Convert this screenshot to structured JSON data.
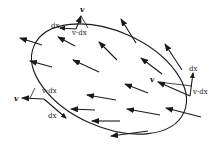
{
  "figure": {
    "colors": {
      "stroke": "#1a1a1a",
      "background": "#ffffff"
    },
    "curve": {
      "shape": "ellipse",
      "cx": 109,
      "cy": 79,
      "rx": 82,
      "ry": 48,
      "rotation_deg": 24
    },
    "field_arrows": [
      {
        "x1": 42,
        "y1": 45,
        "x2": 20,
        "y2": 38
      },
      {
        "x1": 75,
        "y1": 46,
        "x2": 58,
        "y2": 37
      },
      {
        "x1": 117,
        "y1": 60,
        "x2": 99,
        "y2": 42
      },
      {
        "x1": 136,
        "y1": 43,
        "x2": 121,
        "y2": 19
      },
      {
        "x1": 182,
        "y1": 70,
        "x2": 165,
        "y2": 44
      },
      {
        "x1": 52,
        "y1": 67,
        "x2": 30,
        "y2": 61
      },
      {
        "x1": 99,
        "y1": 72,
        "x2": 73,
        "y2": 60
      },
      {
        "x1": 162,
        "y1": 74,
        "x2": 141,
        "y2": 58
      },
      {
        "x1": 148,
        "y1": 93,
        "x2": 125,
        "y2": 84
      },
      {
        "x1": 116,
        "y1": 100,
        "x2": 87,
        "y2": 95
      },
      {
        "x1": 95,
        "y1": 110,
        "x2": 71,
        "y2": 109
      },
      {
        "x1": 160,
        "y1": 115,
        "x2": 127,
        "y2": 109
      },
      {
        "x1": 201,
        "y1": 117,
        "x2": 166,
        "y2": 108
      },
      {
        "x1": 120,
        "y1": 121,
        "x2": 92,
        "y2": 121
      },
      {
        "x1": 148,
        "y1": 131,
        "x2": 111,
        "y2": 136
      }
    ],
    "points": [
      {
        "name": "top",
        "v_label": "v",
        "dx_label": "dx",
        "dot_label": "v·dx",
        "v_arrow": {
          "x1": 76,
          "y1": 29,
          "x2": 81,
          "y2": 16
        },
        "dx_arrow": {
          "x1": 76,
          "y1": 29,
          "x2": 60,
          "y2": 28
        },
        "proj_line": {
          "x1": 81,
          "y1": 16,
          "x2": 88,
          "y2": 28
        },
        "v_pos": {
          "x": 80,
          "y": 12
        },
        "dx_pos": {
          "x": 51,
          "y": 28
        },
        "dot_pos": {
          "x": 72,
          "y": 35
        }
      },
      {
        "name": "left",
        "v_label": "v",
        "dx_label": "dx",
        "dot_label": "v·dx",
        "v_arrow": {
          "x1": 44,
          "y1": 99,
          "x2": 22,
          "y2": 98
        },
        "dx_arrow": {
          "x1": 44,
          "y1": 99,
          "x2": 66,
          "y2": 118
        },
        "proj_line": {
          "x1": 30,
          "y1": 98,
          "x2": 35,
          "y2": 88
        },
        "v_pos": {
          "x": 14,
          "y": 101
        },
        "dx_pos": {
          "x": 48,
          "y": 118
        },
        "dot_pos": {
          "x": 42,
          "y": 93
        }
      },
      {
        "name": "right",
        "v_label": "v",
        "dx_label": "dx",
        "dot_label": "v·dx",
        "v_arrow": {
          "x1": 190,
          "y1": 96,
          "x2": 158,
          "y2": 82
        },
        "dx_arrow": {
          "x1": 190,
          "y1": 96,
          "x2": 193,
          "y2": 73
        },
        "proj_line": {
          "x1": 158,
          "y1": 82,
          "x2": 192,
          "y2": 86
        },
        "v_pos": {
          "x": 150,
          "y": 82
        },
        "dx_pos": {
          "x": 189,
          "y": 71
        },
        "dot_pos": {
          "x": 193,
          "y": 94
        }
      }
    ]
  }
}
